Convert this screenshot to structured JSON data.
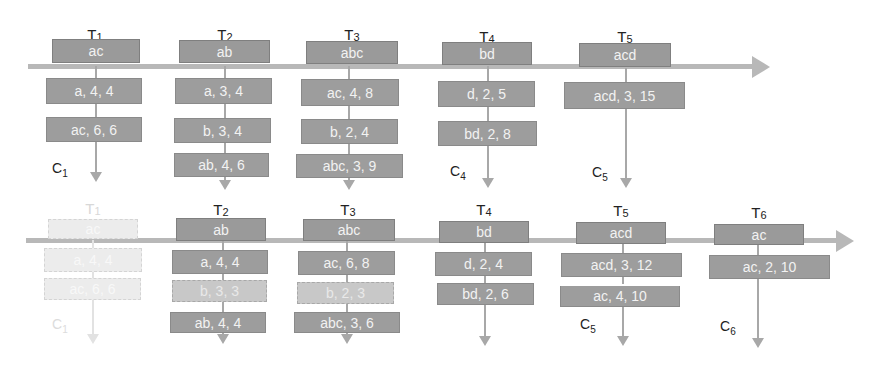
{
  "diagram": {
    "colors": {
      "box": "#9d9d9d",
      "box_text": "#f2f2f2",
      "pale_box": "#c8c8c8",
      "ghost_box": "#ececec",
      "line": "#b8b8b8",
      "label": "#222222"
    },
    "top": {
      "transactions": [
        {
          "id": "T1",
          "t": "T",
          "n": "1",
          "items": "ac",
          "entries": [
            "a, 4, 4",
            "ac, 6, 6"
          ],
          "c_label": "C",
          "c_num": "1"
        },
        {
          "id": "T2",
          "t": "T",
          "n": "2",
          "items": "ab",
          "entries": [
            "a, 3, 4",
            "b, 3, 4",
            "ab, 4, 6"
          ]
        },
        {
          "id": "T3",
          "t": "T",
          "n": "3",
          "items": "abc",
          "entries": [
            "ac, 4, 8",
            "b, 2, 4",
            "abc, 3, 9"
          ]
        },
        {
          "id": "T4",
          "t": "T",
          "n": "4",
          "items": "bd",
          "entries": [
            "d, 2, 5",
            "bd, 2, 8"
          ],
          "c_label": "C",
          "c_num": "4"
        },
        {
          "id": "T5",
          "t": "T",
          "n": "5",
          "items": "acd",
          "entries": [
            "acd, 3, 15"
          ],
          "c_label": "C",
          "c_num": "5"
        }
      ]
    },
    "bottom": {
      "transactions": [
        {
          "id": "T1",
          "t": "T",
          "n": "1",
          "items": "ac",
          "entries": [
            "a, 4, 4",
            "ac, 6, 6"
          ],
          "c_label": "C",
          "c_num": "1",
          "state": "removed"
        },
        {
          "id": "T2",
          "t": "T",
          "n": "2",
          "items": "ab",
          "entries": [
            "a, 4, 4",
            "b, 3, 3",
            "ab, 4, 4"
          ],
          "pale_entries": [
            1
          ]
        },
        {
          "id": "T3",
          "t": "T",
          "n": "3",
          "items": "abc",
          "entries": [
            "ac, 6, 8",
            "b, 2, 3",
            "abc, 3, 6"
          ],
          "pale_entries": [
            1
          ]
        },
        {
          "id": "T4",
          "t": "T",
          "n": "4",
          "items": "bd",
          "entries": [
            "d, 2, 4",
            "bd, 2, 6"
          ]
        },
        {
          "id": "T5",
          "t": "T",
          "n": "5",
          "items": "acd",
          "entries": [
            "acd, 3, 12",
            "ac, 4, 10"
          ],
          "c_label": "C",
          "c_num": "5"
        },
        {
          "id": "T6",
          "t": "T",
          "n": "6",
          "items": "ac",
          "entries": [
            "ac, 2, 10"
          ],
          "c_label": "C",
          "c_num": "6"
        }
      ]
    }
  }
}
